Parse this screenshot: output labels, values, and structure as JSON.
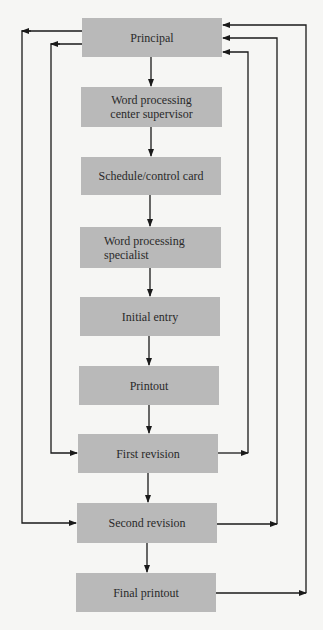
{
  "diagram": {
    "type": "flowchart",
    "colors": {
      "box": "#b9b9b9",
      "line": "#1a1a1a",
      "background": "#f6f6f4"
    },
    "nodes": [
      {
        "id": "principal",
        "label": "Principal"
      },
      {
        "id": "supervisor",
        "label": "Word processing center supervisor"
      },
      {
        "id": "schedule",
        "label": "Schedule/control card"
      },
      {
        "id": "specialist",
        "label": "Word processing specialist"
      },
      {
        "id": "initial",
        "label": "Initial entry"
      },
      {
        "id": "printout",
        "label": "Printout"
      },
      {
        "id": "first",
        "label": "First revision"
      },
      {
        "id": "second",
        "label": "Second revision"
      },
      {
        "id": "final",
        "label": "Final printout"
      }
    ],
    "edges": [
      {
        "from": "principal",
        "to": "supervisor"
      },
      {
        "from": "supervisor",
        "to": "schedule"
      },
      {
        "from": "schedule",
        "to": "specialist"
      },
      {
        "from": "specialist",
        "to": "initial"
      },
      {
        "from": "initial",
        "to": "printout"
      },
      {
        "from": "printout",
        "to": "first"
      },
      {
        "from": "first",
        "to": "second"
      },
      {
        "from": "second",
        "to": "final"
      },
      {
        "from": "principal",
        "to": "first",
        "side": "left"
      },
      {
        "from": "principal",
        "to": "second",
        "side": "left"
      },
      {
        "from": "first",
        "to": "principal",
        "side": "right"
      },
      {
        "from": "second",
        "to": "principal",
        "side": "right"
      },
      {
        "from": "final",
        "to": "principal",
        "side": "right"
      }
    ]
  },
  "labels": {
    "principal": "Principal",
    "supervisor_1": "Word processing",
    "supervisor_2": "center supervisor",
    "schedule": "Schedule/control card",
    "specialist_1": "Word processing",
    "specialist_2": "specialist",
    "initial": "Initial entry",
    "printout": "Printout",
    "first": "First revision",
    "second": "Second revision",
    "final": "Final printout"
  }
}
